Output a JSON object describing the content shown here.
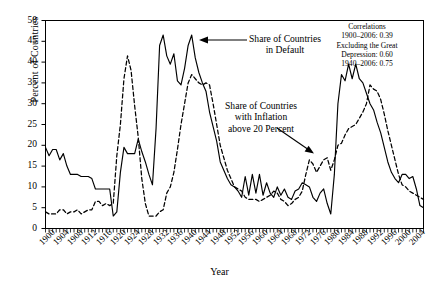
{
  "chart_data": {
    "type": "line",
    "title": "",
    "xlabel": "Year",
    "ylabel": "Percent of Countries",
    "xlim": [
      1900,
      2006
    ],
    "ylim": [
      0,
      50
    ],
    "ytick_step": 5,
    "xtick_step": 4,
    "grid": false,
    "legend_position": "inline-annotations",
    "yticks": [
      "0",
      "5",
      "10",
      "15",
      "20",
      "25",
      "30",
      "35",
      "40",
      "45",
      "50"
    ],
    "xticks": [
      "1900",
      "1904",
      "1908",
      "1912",
      "1916",
      "1920",
      "1924",
      "1928",
      "1932",
      "1936",
      "1940",
      "1944",
      "1948",
      "1952",
      "1956",
      "1960",
      "1964",
      "1968",
      "1972",
      "1976",
      "1980",
      "1984",
      "1988",
      "1992",
      "1996",
      "2000",
      "2004"
    ],
    "series": [
      {
        "name": "Share of Countries in Default",
        "style": "solid",
        "color": "#000000",
        "x": [
          1900,
          1901,
          1902,
          1903,
          1904,
          1905,
          1906,
          1907,
          1908,
          1909,
          1910,
          1911,
          1912,
          1913,
          1914,
          1915,
          1916,
          1917,
          1918,
          1919,
          1920,
          1921,
          1922,
          1923,
          1924,
          1925,
          1926,
          1927,
          1928,
          1929,
          1930,
          1931,
          1932,
          1933,
          1934,
          1935,
          1936,
          1937,
          1938,
          1939,
          1940,
          1941,
          1942,
          1943,
          1944,
          1945,
          1946,
          1947,
          1948,
          1949,
          1950,
          1951,
          1952,
          1953,
          1954,
          1955,
          1956,
          1957,
          1958,
          1959,
          1960,
          1961,
          1962,
          1963,
          1964,
          1965,
          1966,
          1967,
          1968,
          1969,
          1970,
          1971,
          1972,
          1973,
          1974,
          1975,
          1976,
          1977,
          1978,
          1979,
          1980,
          1981,
          1982,
          1983,
          1984,
          1985,
          1986,
          1987,
          1988,
          1989,
          1990,
          1991,
          1992,
          1993,
          1994,
          1995,
          1996,
          1997,
          1998,
          1999,
          2000,
          2001,
          2002,
          2003,
          2004,
          2005,
          2006
        ],
        "values": [
          19.5,
          17.5,
          19.0,
          19.0,
          16.5,
          18.0,
          15.0,
          13.0,
          13.0,
          13.0,
          12.5,
          12.5,
          12.5,
          12.0,
          9.5,
          9.5,
          9.5,
          9.5,
          9.5,
          3.0,
          4.0,
          13.5,
          19.5,
          18.0,
          18.0,
          18.0,
          21.5,
          18.5,
          16.0,
          13.0,
          10.5,
          24.0,
          44.0,
          46.5,
          41.5,
          39.5,
          42.0,
          35.5,
          34.5,
          38.5,
          44.0,
          46.5,
          41.0,
          37.5,
          35.0,
          33.0,
          28.0,
          24.5,
          21.0,
          16.0,
          14.0,
          12.0,
          10.5,
          10.0,
          9.0,
          7.5,
          12.5,
          8.0,
          13.0,
          8.5,
          13.0,
          8.0,
          11.0,
          8.5,
          7.5,
          10.0,
          8.0,
          9.5,
          7.5,
          7.0,
          9.0,
          9.5,
          11.0,
          10.5,
          10.0,
          7.5,
          6.5,
          8.5,
          9.5,
          6.0,
          3.5,
          13.0,
          30.0,
          37.0,
          35.5,
          39.5,
          36.0,
          39.5,
          36.0,
          35.0,
          32.5,
          30.0,
          28.5,
          25.5,
          23.0,
          19.5,
          16.0,
          13.5,
          12.0,
          11.0,
          13.0,
          13.0,
          12.0,
          12.5,
          9.5,
          5.5,
          5.0
        ]
      },
      {
        "name": "Share of Countries with Inflation above 20 Percent",
        "style": "dashed",
        "color": "#000000",
        "x": [
          1900,
          1901,
          1902,
          1903,
          1904,
          1905,
          1906,
          1907,
          1908,
          1909,
          1910,
          1911,
          1912,
          1913,
          1914,
          1915,
          1916,
          1917,
          1918,
          1919,
          1920,
          1921,
          1922,
          1923,
          1924,
          1925,
          1926,
          1927,
          1928,
          1929,
          1930,
          1931,
          1932,
          1933,
          1934,
          1935,
          1936,
          1937,
          1938,
          1939,
          1940,
          1941,
          1942,
          1943,
          1944,
          1945,
          1946,
          1947,
          1948,
          1949,
          1950,
          1951,
          1952,
          1953,
          1954,
          1955,
          1956,
          1957,
          1958,
          1959,
          1960,
          1961,
          1962,
          1963,
          1964,
          1965,
          1966,
          1967,
          1968,
          1969,
          1970,
          1971,
          1972,
          1973,
          1974,
          1975,
          1976,
          1977,
          1978,
          1979,
          1980,
          1981,
          1982,
          1983,
          1984,
          1985,
          1986,
          1987,
          1988,
          1989,
          1990,
          1991,
          1992,
          1993,
          1994,
          1995,
          1996,
          1997,
          1998,
          1999,
          2000,
          2001,
          2002,
          2003,
          2004,
          2005,
          2006
        ],
        "values": [
          4.0,
          3.5,
          3.5,
          3.5,
          4.5,
          4.5,
          3.5,
          4.0,
          4.0,
          4.5,
          3.5,
          4.0,
          4.5,
          4.5,
          6.5,
          6.5,
          5.5,
          6.0,
          5.5,
          6.0,
          17.5,
          25.0,
          36.0,
          41.5,
          38.0,
          29.5,
          22.0,
          12.0,
          6.0,
          3.0,
          3.0,
          3.0,
          4.0,
          4.5,
          8.5,
          10.0,
          13.5,
          19.0,
          25.0,
          30.0,
          35.0,
          37.0,
          36.0,
          35.0,
          34.5,
          35.0,
          34.5,
          30.0,
          25.0,
          20.0,
          17.0,
          14.0,
          12.0,
          10.0,
          9.5,
          9.0,
          7.5,
          7.0,
          7.0,
          7.0,
          6.5,
          7.0,
          7.5,
          8.0,
          9.0,
          8.5,
          7.0,
          6.5,
          5.5,
          6.0,
          7.0,
          7.5,
          9.0,
          13.0,
          16.5,
          15.5,
          13.5,
          15.0,
          16.5,
          17.0,
          14.0,
          16.5,
          20.0,
          20.5,
          22.5,
          24.0,
          24.5,
          25.0,
          26.5,
          28.0,
          30.0,
          34.5,
          33.5,
          33.0,
          31.0,
          27.5,
          23.5,
          20.0,
          16.5,
          13.0,
          10.5,
          10.0,
          9.0,
          8.5,
          8.0,
          7.5,
          7.0
        ]
      }
    ],
    "annotations": [
      {
        "id": "default-annotation",
        "lines": [
          "Share of Countries",
          "in Default"
        ],
        "arrow": "points-left-to-solid-peak-1940"
      },
      {
        "id": "inflation-annotation",
        "lines": [
          "Share of Countries",
          "with Inflation",
          "above 20 Percent"
        ],
        "arrow": "points-down-right-to-dashed-line-1970s"
      },
      {
        "id": "correlations-box",
        "lines": [
          "Correlations",
          "1900–2006: 0.39",
          "Excluding the Great",
          "Depression: 0.60",
          "1940–2006: 0.75"
        ]
      }
    ]
  }
}
